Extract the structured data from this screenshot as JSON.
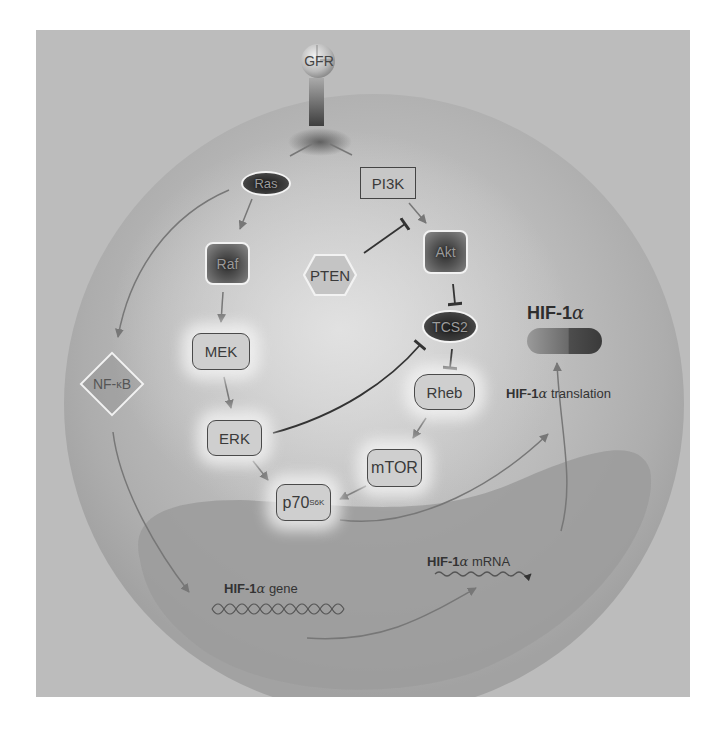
{
  "diagram": {
    "receptor": {
      "label": "GFR"
    },
    "nodes": {
      "ras": "Ras",
      "pi3k": "PI3K",
      "raf": "Raf",
      "pten": "PTEN",
      "akt": "Akt",
      "mek": "MEK",
      "tcs2": "TCS2",
      "rheb": "Rheb",
      "nfkb_prefix": "NF-",
      "nfkb_kappa": "κ",
      "nfkb_suffix": "B",
      "erk": "ERK",
      "mtor": "mTOR",
      "p70_base": "p70",
      "p70_sup": "S6K"
    },
    "hif_protein": {
      "label_prefix": "HIF-1",
      "label_alpha": "α"
    },
    "translation_label": {
      "bold": "HIF-1",
      "alpha": "α",
      "rest": " translation"
    },
    "mrna_label": {
      "bold": "HIF-1",
      "alpha": "α",
      "rest": " mRNA"
    },
    "gene_label": {
      "bold": "HIF-1",
      "alpha": "α",
      "rest": " gene"
    },
    "edges": [
      {
        "from": "GFR",
        "to": "Ras",
        "type": "activation"
      },
      {
        "from": "GFR",
        "to": "PI3K",
        "type": "activation"
      },
      {
        "from": "Ras",
        "to": "Raf",
        "type": "activation"
      },
      {
        "from": "Ras",
        "to": "NF-κB",
        "type": "activation"
      },
      {
        "from": "PI3K",
        "to": "Akt",
        "type": "activation"
      },
      {
        "from": "PTEN",
        "to": "PI3K/Akt",
        "type": "inhibition"
      },
      {
        "from": "Raf",
        "to": "MEK",
        "type": "activation"
      },
      {
        "from": "MEK",
        "to": "ERK",
        "type": "activation"
      },
      {
        "from": "Akt",
        "to": "TCS2",
        "type": "inhibition"
      },
      {
        "from": "ERK",
        "to": "TCS2",
        "type": "inhibition"
      },
      {
        "from": "TCS2",
        "to": "Rheb",
        "type": "inhibition"
      },
      {
        "from": "Rheb",
        "to": "mTOR",
        "type": "activation"
      },
      {
        "from": "ERK",
        "to": "p70S6K",
        "type": "activation"
      },
      {
        "from": "mTOR",
        "to": "p70S6K",
        "type": "activation"
      },
      {
        "from": "p70S6K",
        "to": "HIF-1α translation",
        "type": "activation"
      },
      {
        "from": "NF-κB",
        "to": "HIF-1α gene",
        "type": "activation"
      },
      {
        "from": "HIF-1α gene",
        "to": "HIF-1α mRNA",
        "type": "transcription"
      },
      {
        "from": "HIF-1α mRNA",
        "to": "HIF-1α",
        "type": "translation"
      }
    ],
    "colors": {
      "frame": "#bcbcbc",
      "cell": "#a9a9a9",
      "nucleus": "#9a9a9a",
      "arrow": "#777777",
      "inhibit": "#3a3a3a"
    }
  }
}
